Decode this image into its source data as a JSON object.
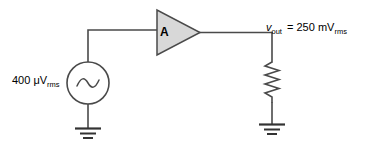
{
  "diagram": {
    "type": "schematic",
    "components": {
      "source": {
        "kind": "ac-voltage-source",
        "label_value": "400",
        "label_unit_prefix": "μ",
        "label_unit": "V",
        "label_subscript": "rms",
        "label_full": "400 μVrms"
      },
      "amplifier": {
        "kind": "triangle-amplifier",
        "label": "A",
        "fill_color": "#d8d8d8",
        "stroke_color": "#4a4a4a"
      },
      "resistor": {
        "kind": "zigzag-resistor",
        "label": ""
      },
      "output_node": {
        "symbol": "v",
        "subscript": "out",
        "equals": "=",
        "value": "250",
        "unit_prefix": "m",
        "unit": "V",
        "unit_subscript": "rms",
        "label_full": "vout = 250 mVrms"
      },
      "ground_left": {
        "kind": "earth-ground",
        "bars": 3
      },
      "ground_right": {
        "kind": "earth-ground",
        "bars": 3
      }
    },
    "colors": {
      "background": "#ffffff",
      "wire": "#4a4a4a",
      "text": "#000000",
      "amplifier_fill": "#d8d8d8"
    }
  }
}
